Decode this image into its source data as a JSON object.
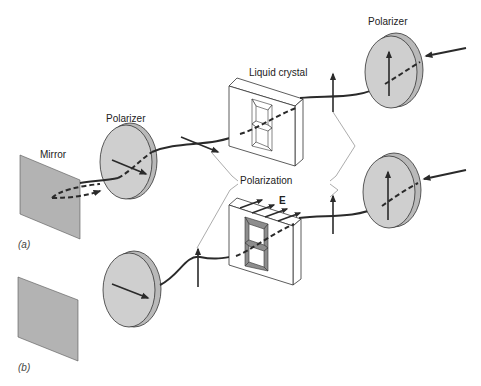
{
  "figure": {
    "panel_a_label": "(a)",
    "panel_b_label": "(b)"
  },
  "labels": {
    "mirror": "Mirror",
    "polarizer_left": "Polarizer",
    "polarizer_right": "Polarizer",
    "liquid_crystal": "Liquid crystal",
    "polarization": "Polarization",
    "field": "E"
  },
  "colors": {
    "component_gray": "#cfcfcf",
    "mirror_gray": "#b3b3b3",
    "beam": "#2a2a2a",
    "background": "#ffffff"
  },
  "panels": [
    {
      "id": "a",
      "components": [
        "Mirror",
        "Polarizer (horizontal axis)",
        "Liquid crystal (off, segments clear)",
        "Polarizer (vertical axis)"
      ],
      "light_reflected": true
    },
    {
      "id": "b",
      "components": [
        "Mirror",
        "Polarizer (horizontal axis)",
        "Liquid crystal (field E applied, segments dark)",
        "Polarizer (vertical axis)"
      ],
      "light_reflected": false
    }
  ]
}
